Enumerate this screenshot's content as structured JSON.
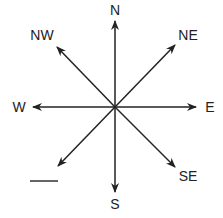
{
  "compass": {
    "labels": {
      "n": "N",
      "ne": "NE",
      "e": "E",
      "se": "SE",
      "s": "S",
      "w": "W",
      "nw": "NW"
    },
    "unlabeled_direction": "SW",
    "blank_line": "answer blank (SW label missing)",
    "line_color": "#222222"
  }
}
